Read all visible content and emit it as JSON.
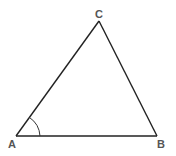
{
  "diagram": {
    "type": "triangle",
    "vertices": {
      "A": {
        "label": "A",
        "x": 16,
        "y": 136
      },
      "B": {
        "label": "B",
        "x": 157,
        "y": 136
      },
      "C": {
        "label": "C",
        "x": 99,
        "y": 21
      }
    },
    "angle_marker": {
      "vertex": "A",
      "radius": 24
    },
    "colors": {
      "stroke": "#222222",
      "label": "#555555",
      "background": "#ffffff"
    }
  }
}
